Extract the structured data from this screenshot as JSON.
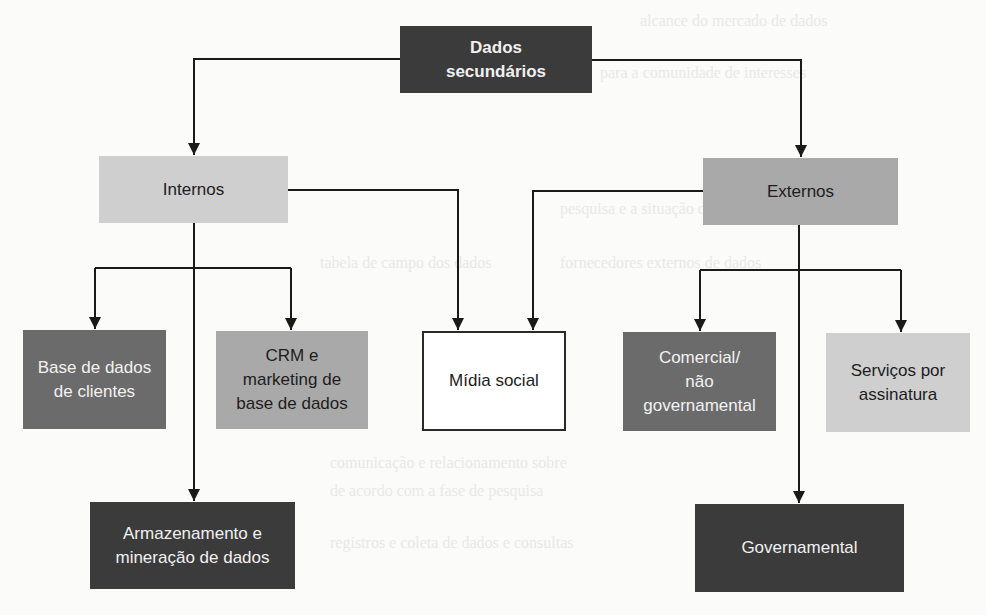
{
  "diagram": {
    "type": "hierarchy",
    "root": {
      "id": "dados_secundarios",
      "label": "Dados\nsecundários",
      "fill": "#3b3b3b"
    },
    "level1": [
      {
        "id": "internos",
        "label": "Internos",
        "fill": "#cfcfcf"
      },
      {
        "id": "externos",
        "label": "Externos",
        "fill": "#a9a9a9"
      }
    ],
    "level2": [
      {
        "id": "base_clientes",
        "label": "Base de dados\nde clientes",
        "parent": "internos",
        "fill": "#6b6b6b"
      },
      {
        "id": "crm",
        "label": "CRM e\nmarketing de\nbase de dados",
        "parent": "internos",
        "fill": "#a9a9a9"
      },
      {
        "id": "midia_social",
        "label": "Mídia social",
        "parents": [
          "internos",
          "externos"
        ],
        "fill": "#ffffff"
      },
      {
        "id": "comercial",
        "label": "Comercial/\nnão\ngovernamental",
        "parent": "externos",
        "fill": "#6b6b6b"
      },
      {
        "id": "servicos",
        "label": "Serviços por\nassinatura",
        "parent": "externos",
        "fill": "#cfcfcf"
      }
    ],
    "level3": [
      {
        "id": "armazenamento",
        "label": "Armazenamento e\nmineração de dados",
        "parent": "internos",
        "fill": "#3b3b3b"
      },
      {
        "id": "governamental",
        "label": "Governamental",
        "parent": "externos",
        "fill": "#3b3b3b"
      }
    ],
    "edges": [
      [
        "dados_secundarios",
        "internos"
      ],
      [
        "dados_secundarios",
        "externos"
      ],
      [
        "internos",
        "base_clientes"
      ],
      [
        "internos",
        "crm"
      ],
      [
        "internos",
        "armazenamento"
      ],
      [
        "internos",
        "midia_social"
      ],
      [
        "externos",
        "midia_social"
      ],
      [
        "externos",
        "comercial"
      ],
      [
        "externos",
        "servicos"
      ],
      [
        "externos",
        "governamental"
      ]
    ],
    "colors": {
      "line": "#1a1a1a",
      "dark": "#3b3b3b",
      "mid": "#6b6b6b",
      "gray": "#a9a9a9",
      "light": "#cfcfcf"
    }
  }
}
